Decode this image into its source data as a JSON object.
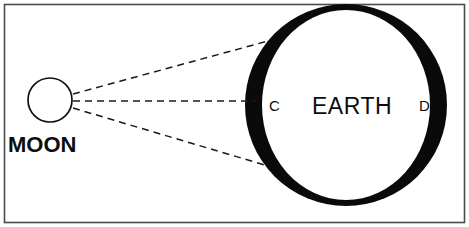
{
  "diagram": {
    "background_color": "#ffffff",
    "border_color": "#4a4a4f",
    "ink_color": "#0a0a0a",
    "labels": {
      "moon": "MOON",
      "earth": "EARTH",
      "point_c": "C",
      "point_d": "D"
    },
    "bodies": [
      {
        "name": "moon",
        "label": "MOON",
        "shape": "circle-outline",
        "cx": 50,
        "cy": 100,
        "r": 22,
        "fill": "#ffffff",
        "stroke": "#111111"
      },
      {
        "name": "earth",
        "label": "EARTH",
        "shape": "annulus",
        "cx": 346,
        "cy": 105,
        "outer_r": 101,
        "inner_rx": 84,
        "inner_ry": 95,
        "fill": "#0a0a0a",
        "inner_fill": "#ffffff"
      }
    ],
    "rays": [
      {
        "name": "upper-ray",
        "from_x": 73,
        "from_y": 94,
        "to_x": 268,
        "to_y": 41,
        "style": "dashed"
      },
      {
        "name": "middle-ray",
        "from_x": 73,
        "from_y": 101,
        "to_x": 255,
        "to_y": 101,
        "style": "dashed"
      },
      {
        "name": "lower-ray",
        "from_x": 73,
        "from_y": 108,
        "to_x": 268,
        "to_y": 166,
        "style": "dashed"
      }
    ]
  }
}
